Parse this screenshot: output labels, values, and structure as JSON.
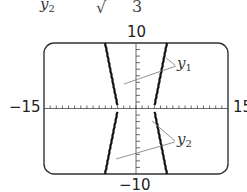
{
  "header_fragment": {
    "left_text": "y",
    "left_sub": "2",
    "sqrt_symbol": "√",
    "right_text": "3"
  },
  "chart_data": {
    "type": "line",
    "title": "",
    "xlabel": "",
    "ylabel": "",
    "xlim": [
      -15,
      15
    ],
    "ylim": [
      -10,
      10
    ],
    "window_labels": {
      "ymax": "10",
      "ymin": "−10",
      "xmin": "−15",
      "xmax": "15"
    },
    "x_tick_step": 1,
    "y_tick_step": 1,
    "grid": false,
    "series": [
      {
        "name": "y1",
        "label": "y",
        "label_sub": "1",
        "branch": "upper",
        "points_left": [
          [
            -3.0,
            0.5
          ],
          [
            -5.0,
            10
          ]
        ],
        "points_right": [
          [
            3.0,
            0.5
          ],
          [
            5.0,
            10
          ]
        ]
      },
      {
        "name": "y2",
        "label": "y",
        "label_sub": "2",
        "branch": "lower",
        "points_left": [
          [
            -3.0,
            -0.5
          ],
          [
            -5.0,
            -10
          ]
        ],
        "points_right": [
          [
            3.0,
            -0.5
          ],
          [
            5.0,
            -10
          ]
        ]
      }
    ]
  }
}
